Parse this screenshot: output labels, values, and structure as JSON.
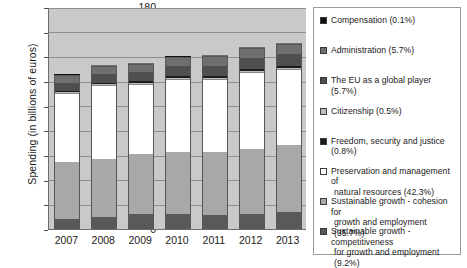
{
  "chart_data": {
    "type": "bar",
    "subtype": "stacked-bar",
    "title": "",
    "xlabel": "",
    "ylabel": "Spending (in billions of euros)",
    "categories": [
      "2007",
      "2008",
      "2009",
      "2010",
      "2011",
      "2012",
      "2013"
    ],
    "ylim": [
      0,
      180
    ],
    "ytick_labels": [
      "0",
      "20",
      "40",
      "60",
      "80",
      "100",
      "120",
      "140",
      "160",
      "180"
    ],
    "ytick_values": [
      0,
      20,
      40,
      60,
      80,
      100,
      120,
      140,
      160,
      180
    ],
    "grid": true,
    "grid_axis": "y",
    "legend_position": "right",
    "plot_background": "#c9c9c9",
    "series": [
      {
        "name": "Sustainable growth - competitiveness for growth and employment (9.2%)",
        "short_name": "competitiveness",
        "color": "#595959",
        "share": "9.2%",
        "values": [
          8.0,
          9.5,
          12.0,
          12.5,
          11.5,
          12.5,
          13.5
        ]
      },
      {
        "name": "Sustainable growth - cohesion for growth and employment (35.7%)",
        "short_name": "cohesion",
        "color": "#a8a8a8",
        "share": "35.7%",
        "values": [
          46.0,
          47.5,
          48.5,
          50.0,
          51.0,
          52.5,
          54.5
        ]
      },
      {
        "name": "Preservation and management of natural resources (42.3%)",
        "short_name": "natural-resources",
        "color": "#ffffff",
        "share": "42.3%",
        "values": [
          55.5,
          59.0,
          56.5,
          58.5,
          58.5,
          61.5,
          61.0
        ]
      },
      {
        "name": "Citizenship (0.5%)",
        "short_name": "citizenship",
        "color": "#bcbcbc",
        "share": "0.5%",
        "values": [
          0.6,
          0.6,
          0.7,
          0.7,
          0.7,
          0.7,
          0.8
        ]
      },
      {
        "name": "Freedom, security and justice (0.8%)",
        "short_name": "freedom-security-justice",
        "color": "#1c1c1c",
        "share": "0.8%",
        "values": [
          1.1,
          1.2,
          1.3,
          1.4,
          1.5,
          1.6,
          1.7
        ]
      },
      {
        "name": "The EU as a global player (5.7%)",
        "short_name": "global-player",
        "color": "#4f4f4f",
        "share": "5.7%",
        "values": [
          6.5,
          7.0,
          7.4,
          7.9,
          8.4,
          8.9,
          9.4
        ]
      },
      {
        "name": "Administration (5.7%)",
        "short_name": "administration",
        "color": "#6f6f6f",
        "share": "5.7%",
        "values": [
          6.8,
          7.2,
          7.6,
          8.0,
          8.4,
          8.8,
          9.3
        ]
      },
      {
        "name": "Compensation (0.1%)",
        "short_name": "compensation",
        "color": "#111111",
        "share": "0.1%",
        "values": [
          0.4,
          0.2,
          0.2,
          0.2,
          0.2,
          0.2,
          0.2
        ]
      }
    ],
    "totals": [
      124.9,
      132.2,
      134.2,
      139.2,
      140.2,
      146.7,
      150.4
    ]
  },
  "legend": {
    "items": [
      {
        "swatch": "#111111",
        "lines": [
          "Compensation (0.1%)"
        ]
      },
      {
        "swatch": "#6f6f6f",
        "lines": [
          "Administration (5.7%)"
        ]
      },
      {
        "swatch": "#4f4f4f",
        "lines": [
          "The EU as a global player (5.7%)"
        ]
      },
      {
        "swatch": "#bcbcbc",
        "lines": [
          "Citizenship (0.5%)"
        ]
      },
      {
        "swatch": "#1c1c1c",
        "lines": [
          "Freedom, security and justice (0.8%)"
        ]
      },
      {
        "swatch": "#ffffff",
        "lines": [
          "Preservation and management of",
          "natural resources (42.3%)"
        ]
      },
      {
        "swatch": "#a8a8a8",
        "lines": [
          "Sustainable growth - cohesion for",
          "growth and employment (35.7%)"
        ]
      },
      {
        "swatch": "#595959",
        "lines": [
          "Sustainable growth - competitiveness",
          "for growth and employment (9.2%)"
        ]
      }
    ]
  }
}
